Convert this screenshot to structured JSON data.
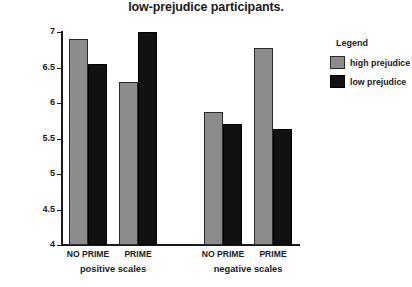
{
  "chart_data": {
    "type": "bar",
    "title": "low-prejudice participants.",
    "xlabel": "",
    "ylabel": "",
    "ylim": [
      4,
      7
    ],
    "yticks": [
      "4",
      "4.5",
      "5",
      "5.5",
      "6",
      "6.5",
      "7"
    ],
    "grid": false,
    "legend": {
      "title": "Legend",
      "position": "right",
      "entries": [
        {
          "name": "high prejudice",
          "color": "#8c8c8c"
        },
        {
          "name": "low prejudice",
          "color": "#111111"
        }
      ]
    },
    "groups": [
      {
        "label": "positive scales",
        "categories": [
          "NO PRIME",
          "PRIME"
        ]
      },
      {
        "label": "negative scales",
        "categories": [
          "NO PRIME",
          "PRIME"
        ]
      }
    ],
    "categories": [
      "positive / NO PRIME",
      "positive / PRIME",
      "negative / NO PRIME",
      "negative / PRIME"
    ],
    "series": [
      {
        "name": "high prejudice",
        "color": "#8c8c8c",
        "values": [
          6.9,
          6.3,
          5.88,
          6.78
        ]
      },
      {
        "name": "low prejudice",
        "color": "#111111",
        "values": [
          6.55,
          7.0,
          5.7,
          5.63
        ]
      }
    ],
    "bars": [
      {
        "group": "positive scales",
        "category": "NO PRIME",
        "series": "high prejudice",
        "value": 6.9
      },
      {
        "group": "positive scales",
        "category": "NO PRIME",
        "series": "low prejudice",
        "value": 6.55
      },
      {
        "group": "positive scales",
        "category": "PRIME",
        "series": "high prejudice",
        "value": 6.3
      },
      {
        "group": "positive scales",
        "category": "PRIME",
        "series": "low prejudice",
        "value": 7.0
      },
      {
        "group": "negative scales",
        "category": "NO PRIME",
        "series": "high prejudice",
        "value": 5.88
      },
      {
        "group": "negative scales",
        "category": "NO PRIME",
        "series": "low prejudice",
        "value": 5.7
      },
      {
        "group": "negative scales",
        "category": "PRIME",
        "series": "high prejudice",
        "value": 6.78
      },
      {
        "group": "negative scales",
        "category": "PRIME",
        "series": "low prejudice",
        "value": 5.63
      }
    ]
  }
}
